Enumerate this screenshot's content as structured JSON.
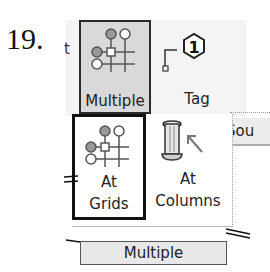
{
  "step": {
    "number": "19."
  },
  "ribbon": {
    "left_partial_letter": "t",
    "buttons": [
      {
        "id": "multiple",
        "label": "Multiple",
        "icon": "multiple-tag-grid-icon",
        "state": "pressed"
      },
      {
        "id": "tag",
        "label": "Tag",
        "icon": "tag-hexagon-icon",
        "tag_number": "1"
      }
    ],
    "partial_tab_label": "Sou"
  },
  "dropdown": {
    "items": [
      {
        "id": "at-grids",
        "line1": "At",
        "line2": "Grids",
        "icon": "grid-tag-icon",
        "state": "highlighted"
      },
      {
        "id": "at-columns",
        "line1": "At",
        "line2": "Columns",
        "icon": "column-arrow-icon"
      }
    ],
    "footer_label": "Multiple"
  },
  "colors": {
    "pressed_bg": "#d9d9d9",
    "border_dark": "#111111",
    "ribbon_bg": "#f4f4f4"
  }
}
